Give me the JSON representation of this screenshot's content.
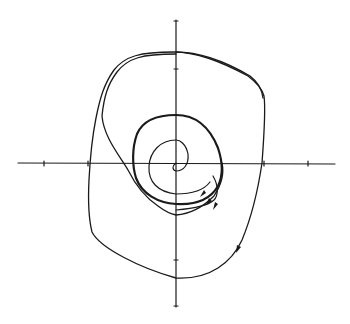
{
  "figure": {
    "type": "phase-portrait",
    "stroke_color": "#1a1a1a",
    "background": "#ffffff",
    "axes": {
      "x_axis": {
        "x1": 18,
        "x2": 335,
        "y": 163,
        "ticks": [
          44,
          88,
          264,
          308
        ]
      },
      "y_axis": {
        "x": 176,
        "y1": 20,
        "y2": 307,
        "ticks": [
          69,
          260
        ]
      },
      "origin": [
        176,
        163
      ]
    },
    "trajectories": [
      {
        "name": "outer-spiral-in",
        "direction": "inward"
      },
      {
        "name": "limit-cycle",
        "direction": "clockwise"
      },
      {
        "name": "inner-spiral-out",
        "direction": "outward"
      }
    ],
    "arrows": 5
  }
}
